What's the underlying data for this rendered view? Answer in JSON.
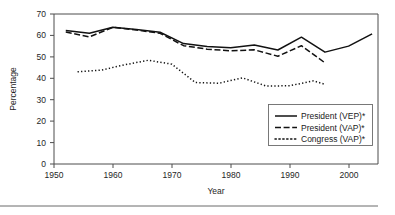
{
  "chart_data": {
    "type": "line",
    "title": "",
    "xlabel": "Year",
    "ylabel": "Percentage",
    "xlim": [
      1950,
      2005
    ],
    "ylim": [
      0,
      70
    ],
    "xticks": [
      1950,
      1960,
      1970,
      1980,
      1990,
      2000
    ],
    "yticks": [
      0,
      10,
      20,
      30,
      40,
      50,
      60,
      70
    ],
    "grid": false,
    "legend_position": "lower right",
    "series": [
      {
        "name": "President (VEP)*",
        "style": "solid",
        "x": [
          1952,
          1956,
          1960,
          1964,
          1968,
          1972,
          1976,
          1980,
          1984,
          1988,
          1992,
          1996,
          2000,
          2004
        ],
        "values": [
          62.3,
          61.0,
          63.8,
          62.8,
          61.5,
          56.2,
          54.8,
          54.3,
          55.5,
          53.2,
          59.2,
          52.2,
          55.0,
          60.7
        ]
      },
      {
        "name": "President (VAP)*",
        "style": "dashed",
        "x": [
          1952,
          1956,
          1960,
          1964,
          1968,
          1972,
          1976,
          1980,
          1984,
          1988,
          1992,
          1996
        ],
        "values": [
          61.6,
          59.3,
          63.8,
          62.5,
          61.0,
          55.2,
          53.6,
          52.8,
          53.3,
          50.3,
          55.2,
          47.2
        ]
      },
      {
        "name": "Congress (VAP)*",
        "style": "dotted",
        "x": [
          1954,
          1958,
          1962,
          1966,
          1970,
          1974,
          1978,
          1982,
          1986,
          1990,
          1994,
          1996
        ],
        "values": [
          43.0,
          43.8,
          46.3,
          48.4,
          46.6,
          38.0,
          37.7,
          40.2,
          36.4,
          36.5,
          38.8,
          37.2
        ]
      }
    ]
  },
  "legend": {
    "entries": [
      {
        "label": "President (VEP)*",
        "style": "solid"
      },
      {
        "label": "President (VAP)*",
        "style": "dashed"
      },
      {
        "label": "Congress (VAP)*",
        "style": "dotted"
      }
    ]
  },
  "axes": {
    "y_title": "Percentage",
    "x_title": "Year",
    "x_tick_labels": [
      "1950",
      "1960",
      "1970",
      "1980",
      "1990",
      "2000"
    ],
    "y_tick_labels": [
      "0",
      "10",
      "20",
      "30",
      "40",
      "50",
      "60",
      "70"
    ]
  },
  "colors": {
    "line": "#121212",
    "axis": "#4d4d4d",
    "text": "#262626",
    "background": "#ffffff"
  }
}
